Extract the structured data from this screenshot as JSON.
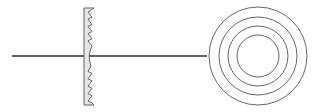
{
  "diagram": {
    "title": "",
    "colors": {
      "background": "#ffffff",
      "stroke": "#555555",
      "axis": "#333333",
      "lens_fill": "#e6e6e6"
    },
    "optical_axis": {
      "x1": 12,
      "x2": 207,
      "y": 56
    },
    "lens_profile": {
      "x_flat": 84,
      "top": 8,
      "bottom": 105,
      "teeth_top": 5,
      "teeth_bottom": 5
    },
    "front_view": {
      "cx": 258,
      "cy": 56,
      "radii": [
        49,
        39,
        30,
        21
      ]
    }
  }
}
